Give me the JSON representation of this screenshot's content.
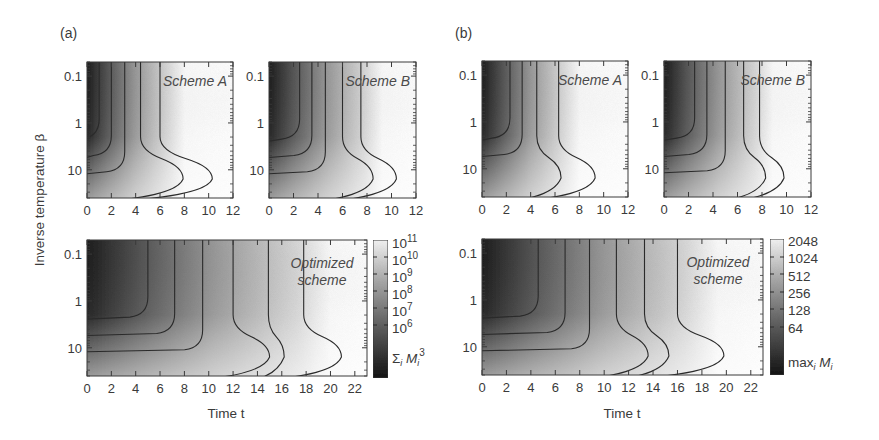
{
  "figure": {
    "panel_labels": [
      "(a)",
      "(b)"
    ],
    "y_axis_title": "Inverse temperature β",
    "x_axis_title": "Time t"
  },
  "chart_data": [
    {
      "type": "heatmap",
      "panel": "(a)",
      "title": "Scheme A",
      "quantity": "Σ_i M_i^3",
      "xlabel": "",
      "ylabel": "Inverse temperature β",
      "xlim": [
        0,
        12
      ],
      "x_ticks": [
        0,
        2,
        4,
        6,
        8,
        10,
        12
      ],
      "ylim": [
        0.05,
        40
      ],
      "y_scale": "log",
      "y_ticks": [
        "0.1",
        "1",
        "10"
      ],
      "contour_levels_log10": [
        6,
        7,
        8,
        9,
        10,
        11
      ],
      "contour_x_at_high_temp": [
        1.0,
        2.0,
        3.1,
        4.4,
        6.0
      ],
      "contour_max_x": [
        3.5,
        4.8,
        6.9,
        10.3
      ]
    },
    {
      "type": "heatmap",
      "panel": "(a)",
      "title": "Scheme B",
      "quantity": "Σ_i M_i^3",
      "xlim": [
        0,
        12
      ],
      "x_ticks": [
        0,
        2,
        4,
        6,
        8,
        10,
        12
      ],
      "ylim": [
        0.05,
        40
      ],
      "y_scale": "log",
      "y_ticks": [
        "0.1",
        "1",
        "10"
      ],
      "contour_x_at_high_temp": [
        2.5,
        3.5,
        4.6,
        6.0,
        7.5
      ],
      "contour_max_x": [
        4.0,
        6.0,
        8.2,
        10.4
      ]
    },
    {
      "type": "heatmap",
      "panel": "(a)",
      "title": "Optimized scheme",
      "quantity": "Σ_i M_i^3",
      "xlabel": "Time t",
      "ylabel": "Inverse temperature β",
      "xlim": [
        0,
        23
      ],
      "x_ticks": [
        0,
        2,
        4,
        6,
        8,
        10,
        12,
        14,
        16,
        18,
        20,
        22
      ],
      "ylim": [
        0.05,
        40
      ],
      "y_scale": "log",
      "y_ticks": [
        "0.1",
        "1",
        "10"
      ],
      "contour_x_at_high_temp": [
        5.0,
        7.2,
        9.5,
        12.0,
        14.9,
        17.8
      ],
      "contour_max_x": [
        12.0,
        16.2,
        20.9
      ],
      "colorbar": {
        "label": "Σ_i M_i^3",
        "ticks": [
          "10^11",
          "10^10",
          "10^9",
          "10^8",
          "10^7",
          "10^6"
        ]
      }
    },
    {
      "type": "heatmap",
      "panel": "(b)",
      "title": "Scheme A",
      "quantity": "max_i M_i",
      "xlim": [
        0,
        12
      ],
      "x_ticks": [
        0,
        2,
        4,
        6,
        8,
        10,
        12
      ],
      "ylim": [
        0.05,
        40
      ],
      "y_scale": "log",
      "y_ticks": [
        "0.1",
        "1",
        "10"
      ],
      "contour_x_at_high_temp": [
        2.3,
        3.3,
        4.5,
        6.3
      ],
      "contour_max_x": [
        5.5,
        7.5,
        10.5
      ]
    },
    {
      "type": "heatmap",
      "panel": "(b)",
      "title": "Scheme B",
      "quantity": "max_i M_i",
      "xlim": [
        0,
        12
      ],
      "x_ticks": [
        0,
        2,
        4,
        6,
        8,
        10,
        12
      ],
      "ylim": [
        0.05,
        40
      ],
      "y_scale": "log",
      "y_ticks": [
        "0.1",
        "1",
        "10"
      ],
      "contour_x_at_high_temp": [
        2.5,
        3.5,
        5.0,
        6.5,
        7.8
      ],
      "contour_max_x": [
        3.8,
        5.5,
        7.4,
        9.8
      ]
    },
    {
      "type": "heatmap",
      "panel": "(b)",
      "title": "Optimized scheme",
      "quantity": "max_i M_i",
      "xlabel": "Time t",
      "xlim": [
        0,
        23
      ],
      "x_ticks": [
        0,
        2,
        4,
        6,
        8,
        10,
        12,
        14,
        16,
        18,
        20,
        22
      ],
      "ylim": [
        0.05,
        40
      ],
      "y_scale": "log",
      "y_ticks": [
        "0.1",
        "1",
        "10"
      ],
      "contour_x_at_high_temp": [
        4.6,
        6.8,
        8.8,
        11.0,
        13.3,
        16.0
      ],
      "contour_max_x": [
        11.0,
        15.3,
        19.8
      ],
      "colorbar": {
        "label": "max_i M_i",
        "ticks": [
          "2048",
          "1024",
          "512",
          "256",
          "128",
          "64"
        ]
      }
    }
  ],
  "plots": [
    {
      "id": "a-A",
      "title": "Scheme A",
      "x": 87,
      "y": 62,
      "w": 146,
      "h": 136,
      "xmax": 12,
      "contours": [
        1.0,
        2.0,
        3.1,
        4.4,
        6.0
      ],
      "bulge": [
        0.9,
        1.7,
        2.6,
        3.5,
        4.3
      ],
      "light": 0.55
    },
    {
      "id": "a-B",
      "title": "Scheme B",
      "x": 269,
      "y": 62,
      "w": 147,
      "h": 136,
      "xmax": 12,
      "contours": [
        2.5,
        3.5,
        4.6,
        6.0,
        7.5
      ],
      "bulge": [
        0.8,
        1.4,
        2.0,
        2.5,
        2.9
      ],
      "light": 0.65
    },
    {
      "id": "a-O",
      "title": "Optimized scheme",
      "x": 87,
      "y": 240,
      "w": 280,
      "h": 136,
      "xmax": 23,
      "contours": [
        5.0,
        7.2,
        9.5,
        12.0,
        14.9,
        17.8
      ],
      "bulge": [
        1.2,
        1.9,
        2.5,
        3.0,
        1.3,
        3.1
      ],
      "light": 0.75
    },
    {
      "id": "b-A",
      "title": "Scheme A",
      "x": 482,
      "y": 61,
      "w": 146,
      "h": 136,
      "xmax": 12,
      "contours": [
        2.3,
        3.3,
        4.5,
        6.3
      ],
      "bulge": [
        0.6,
        1.2,
        2.0,
        3.0
      ],
      "light": 0.55
    },
    {
      "id": "b-B",
      "title": "Scheme B",
      "x": 664,
      "y": 61,
      "w": 147,
      "h": 136,
      "xmax": 12,
      "contours": [
        2.5,
        3.5,
        5.0,
        6.5,
        7.8
      ],
      "bulge": [
        0.6,
        1.0,
        1.4,
        1.8,
        2.0
      ],
      "light": 0.62
    },
    {
      "id": "b-O",
      "title": "Optimized scheme",
      "x": 482,
      "y": 239,
      "w": 281,
      "h": 136,
      "xmax": 23,
      "contours": [
        4.6,
        6.8,
        8.8,
        11.0,
        13.3,
        16.0
      ],
      "bulge": [
        0.8,
        1.5,
        2.2,
        2.6,
        2.0,
        3.8
      ],
      "light": 0.72
    }
  ],
  "colorbars": [
    {
      "x": 373,
      "y": 240,
      "w": 15,
      "h": 138,
      "labels": [
        {
          "base": "10",
          "exp": "11",
          "y": 248
        },
        {
          "base": "10",
          "exp": "10",
          "y": 265
        },
        {
          "base": "10",
          "exp": "9",
          "y": 282
        },
        {
          "base": "10",
          "exp": "8",
          "y": 299
        },
        {
          "base": "10",
          "exp": "7",
          "y": 316
        },
        {
          "base": "10",
          "exp": "6",
          "y": 333
        }
      ],
      "ticks_y": [
        257,
        274,
        291,
        308,
        325
      ],
      "name_main": "Σ",
      "name_sub": "i",
      "name_var": "M",
      "name_sub2": "i",
      "name_sup": "3",
      "name_y": 363
    },
    {
      "x": 770,
      "y": 239,
      "w": 14,
      "h": 136,
      "labels": [
        {
          "base": "2048",
          "exp": "",
          "y": 246
        },
        {
          "base": "1024",
          "exp": "",
          "y": 263
        },
        {
          "base": "512",
          "exp": "",
          "y": 281
        },
        {
          "base": "256",
          "exp": "",
          "y": 298
        },
        {
          "base": "128",
          "exp": "",
          "y": 315
        },
        {
          "base": "64",
          "exp": "",
          "y": 333
        }
      ],
      "ticks_y": [
        257,
        274,
        292,
        309,
        327
      ],
      "name_main": "max",
      "name_sub": "i",
      "name_var": "M",
      "name_sub2": "i",
      "name_sup": "",
      "name_y": 367
    }
  ],
  "layout": {
    "panel_label_pos": [
      {
        "x": 60,
        "y": 38
      },
      {
        "x": 455,
        "y": 38
      }
    ],
    "y_title_pos": {
      "x": 44,
      "y": 200
    },
    "x_title_pos": [
      {
        "x": 226,
        "y": 418
      },
      {
        "x": 622,
        "y": 418
      }
    ],
    "y_tick_labels": [
      "0.1",
      "1",
      "10"
    ]
  }
}
